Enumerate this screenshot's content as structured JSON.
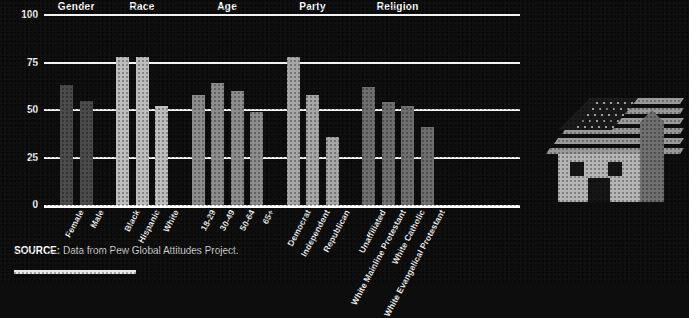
{
  "chart_data": {
    "type": "bar",
    "title": "",
    "xlabel": "",
    "ylabel": "",
    "ylim": [
      0,
      100
    ],
    "yticks": [
      0,
      25,
      50,
      75,
      100
    ],
    "grid": true,
    "legend": "none",
    "groups": [
      {
        "name": "Gender",
        "color": "#4a4a4a",
        "categories": [
          "Female",
          "Male"
        ],
        "values": [
          63,
          55
        ]
      },
      {
        "name": "Race",
        "color": "#bdbdbd",
        "categories": [
          "Black",
          "Hispanic",
          "White"
        ],
        "values": [
          78,
          78,
          52
        ]
      },
      {
        "name": "Age",
        "color": "#8c8c8c",
        "categories": [
          "18-29",
          "30-49",
          "50-64",
          "65+"
        ],
        "values": [
          58,
          64,
          60,
          49
        ]
      },
      {
        "name": "Party",
        "color": "#a6a6a6",
        "categories": [
          "Democrat",
          "Independent",
          "Republican"
        ],
        "values": [
          78,
          58,
          36
        ]
      },
      {
        "name": "Religion",
        "color": "#6e6e6e",
        "categories": [
          "Unaffiliated",
          "White Mainline Protestant",
          "White Catholic",
          "White Evangelical Protestant"
        ],
        "values": [
          62,
          54,
          52,
          41
        ]
      }
    ],
    "categories": [
      "Female",
      "Male",
      "Black",
      "Hispanic",
      "White",
      "18-29",
      "30-49",
      "50-64",
      "65+",
      "Democrat",
      "Independent",
      "Republican",
      "Unaffiliated",
      "White Mainline Protestant",
      "White Catholic",
      "White Evangelical Protestant"
    ],
    "values": [
      63,
      55,
      78,
      78,
      52,
      58,
      64,
      60,
      49,
      78,
      58,
      36,
      62,
      54,
      52,
      41
    ]
  },
  "source": {
    "prefix": "SOURCE:",
    "text": " Data from Pew Global Attitudes Project."
  },
  "illustration": {
    "name": "house-with-american-flag-roof",
    "flag_color": "#9a9a9a",
    "house_color": "#b5b5b5",
    "chimney_color": "#6f6f6f"
  },
  "colors": {
    "background": "#0d0d0d",
    "axis": "#ffffff",
    "text": "#ffffff"
  }
}
